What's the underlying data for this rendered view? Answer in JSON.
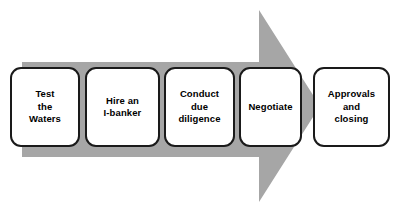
{
  "diagram": {
    "arrow": {
      "icon": "right-arrow-shape",
      "color": "#a6a6a6",
      "direction": "right"
    },
    "colors": {
      "arrow_fill": "#a6a6a6",
      "box_fill": "#ffffff",
      "box_border": "#1a1a1a",
      "text": "#000000",
      "background": "#ffffff"
    },
    "stages": [
      {
        "id": "test-the-waters",
        "label": "Test\nthe\nWaters",
        "order": 1
      },
      {
        "id": "hire-an-i-banker",
        "label": "Hire an\nI-banker",
        "order": 2
      },
      {
        "id": "conduct-due-diligence",
        "label": "Conduct\ndue diligence",
        "order": 3
      },
      {
        "id": "negotiate",
        "label": "Negotiate",
        "order": 4
      },
      {
        "id": "approvals-and-closing",
        "label": "Approvals\nand\nclosing",
        "order": 5
      }
    ]
  }
}
